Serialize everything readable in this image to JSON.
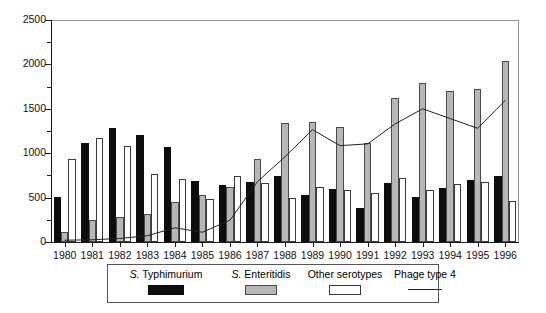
{
  "chart_data": {
    "type": "bar",
    "title": "",
    "subtitle": "",
    "xlabel": "",
    "ylabel": "",
    "ylim": [
      0,
      2500
    ],
    "ytick_values": [
      0,
      500,
      1000,
      1500,
      2000,
      2500
    ],
    "ytick_labels": [
      "0",
      "500",
      "1000",
      "1500",
      "2000",
      "2500"
    ],
    "yminor_tick_values": [
      250,
      750,
      1250,
      1750,
      2250
    ],
    "grid": false,
    "legend_position": "bottom",
    "categories": [
      "1980",
      "1981",
      "1982",
      "1983",
      "1984",
      "1985",
      "1986",
      "1987",
      "1988",
      "1989",
      "1990",
      "1991",
      "1992",
      "1993",
      "1994",
      "1995",
      "1996"
    ],
    "series": [
      {
        "name": "S. Typhimurium",
        "kind": "bar",
        "color": "#0d0d0d",
        "values": [
          510,
          1120,
          1280,
          1210,
          1065,
          685,
          640,
          675,
          740,
          535,
          600,
          385,
          660,
          505,
          610,
          695,
          745
        ]
      },
      {
        "name": "S. Enteritidis",
        "kind": "bar",
        "color": "#b7b7b7",
        "values": [
          115,
          250,
          280,
          310,
          455,
          525,
          620,
          930,
          1340,
          1355,
          1295,
          1110,
          1620,
          1790,
          1695,
          1720,
          2040
        ]
      },
      {
        "name": "Other serotypes",
        "kind": "bar",
        "color": "#ffffff",
        "values": [
          930,
          1170,
          1085,
          770,
          710,
          485,
          745,
          670,
          495,
          620,
          590,
          555,
          720,
          590,
          650,
          675,
          465
        ]
      },
      {
        "name": "Phage type 4",
        "kind": "line",
        "color": "#222222",
        "values": [
          20,
          25,
          40,
          70,
          160,
          110,
          245,
          680,
          960,
          1265,
          1085,
          1105,
          1330,
          1500,
          1390,
          1280,
          1595
        ]
      }
    ]
  },
  "legend": {
    "items": [
      {
        "label_italic": "S.",
        "label_rest": " Typhimurium",
        "swatch": "black-filled-rect"
      },
      {
        "label_italic": "S.",
        "label_rest": " Enteritidis",
        "swatch": "gray-filled-rect"
      },
      {
        "label_italic": "",
        "label_rest": "Other serotypes",
        "swatch": "white-open-rect"
      },
      {
        "label_italic": "",
        "label_rest": "Phage type 4",
        "swatch": "line-sample"
      }
    ]
  }
}
